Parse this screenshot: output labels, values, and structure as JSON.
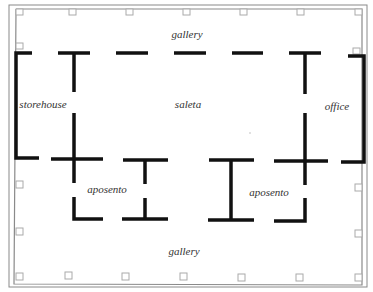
{
  "diagram": {
    "type": "floor-plan",
    "colors": {
      "wall": "#111111",
      "outline": "#888888",
      "pillar": "#aaaaaa",
      "label": "#333333",
      "background": "#ffffff"
    },
    "labels": {
      "gallery_top": "gallery",
      "storehouse": "storehouse",
      "saleta": "saleta",
      "office": "office",
      "aposento_left": "aposento",
      "aposento_right": "aposento",
      "gallery_bottom": "gallery"
    },
    "rooms": [
      "gallery",
      "storehouse",
      "saleta",
      "office",
      "aposento",
      "aposento",
      "gallery"
    ]
  }
}
